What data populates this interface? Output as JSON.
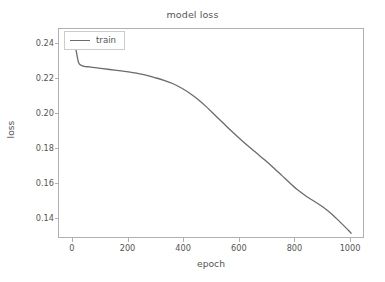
{
  "chart_data": {
    "type": "line",
    "title": "model loss",
    "xlabel": "epoch",
    "ylabel": "loss",
    "xlim": [
      -50,
      1050
    ],
    "ylim": [
      0.1285,
      0.2485
    ],
    "grid": false,
    "legend_position": "upper left",
    "xticks": [
      0,
      200,
      400,
      600,
      800,
      1000
    ],
    "xtick_labels": [
      "0",
      "200",
      "400",
      "600",
      "800",
      "1000"
    ],
    "yticks": [
      0.14,
      0.16,
      0.18,
      0.2,
      0.22,
      0.24
    ],
    "ytick_labels": [
      "0.14",
      "0.16",
      "0.18",
      "0.20",
      "0.22",
      "0.24"
    ],
    "line_color": "#6b6b6b",
    "line_width": 1.3,
    "series": [
      {
        "name": "train",
        "x": [
          0,
          10,
          20,
          30,
          40,
          60,
          80,
          100,
          150,
          200,
          250,
          300,
          330,
          360,
          390,
          420,
          450,
          480,
          510,
          540,
          570,
          600,
          630,
          660,
          690,
          720,
          750,
          780,
          810,
          840,
          870,
          900,
          930,
          960,
          990,
          1000
        ],
        "values": [
          0.2445,
          0.2375,
          0.2295,
          0.2278,
          0.2272,
          0.2268,
          0.2264,
          0.226,
          0.225,
          0.224,
          0.2226,
          0.2205,
          0.219,
          0.2172,
          0.2148,
          0.2118,
          0.2082,
          0.204,
          0.1994,
          0.1948,
          0.1902,
          0.1858,
          0.1816,
          0.1776,
          0.1736,
          0.1694,
          0.165,
          0.1605,
          0.1563,
          0.1528,
          0.1498,
          0.1466,
          0.1428,
          0.1383,
          0.1335,
          0.1318
        ]
      }
    ]
  },
  "legend": {
    "entries": [
      {
        "label": "train",
        "color": "#6b6b6b"
      }
    ]
  }
}
